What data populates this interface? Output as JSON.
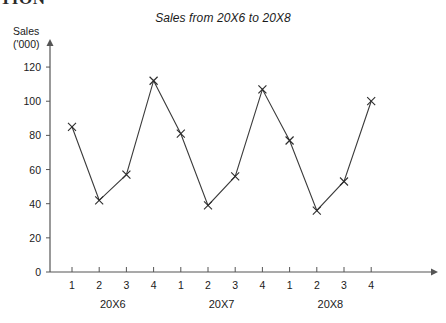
{
  "page": {
    "clipped_heading_fragment": "TION",
    "background_color": "#ffffff"
  },
  "chart_data": {
    "type": "line",
    "title": "Sales from 20X6 to 20X8",
    "ylabel_line1": "Sales",
    "ylabel_line2": "('000)",
    "xlabel": "",
    "categories": [
      "1",
      "2",
      "3",
      "4",
      "1",
      "2",
      "3",
      "4",
      "1",
      "2",
      "3",
      "4"
    ],
    "values": [
      85,
      42,
      57,
      112,
      81,
      39,
      56,
      107,
      77,
      36,
      53,
      100
    ],
    "group_labels": [
      "20X6",
      "20X7",
      "20X8"
    ],
    "ytick_labels": [
      "0",
      "20",
      "40",
      "60",
      "80",
      "100",
      "120"
    ],
    "ytick_values": [
      0,
      20,
      40,
      60,
      80,
      100,
      120
    ],
    "ylim": [
      0,
      130
    ],
    "xlim": [
      0,
      13
    ],
    "grid": false,
    "legend": false,
    "marker": "x-cross",
    "series_color": "#3b3b3b",
    "axis_color": "#555555"
  }
}
